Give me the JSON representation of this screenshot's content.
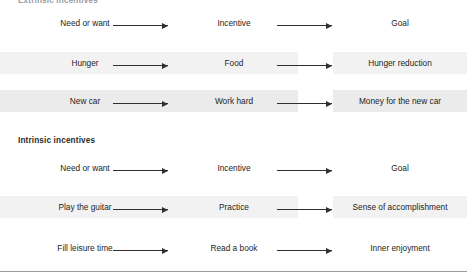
{
  "figure": {
    "sections": [
      {
        "caption": "Extrinsic incentives",
        "caption_clipped": true,
        "rows": [
          {
            "shading": "none",
            "source": "Need or want",
            "incentive": "Incentive",
            "goal": "Goal"
          },
          {
            "shading": "soft",
            "source": "Hunger",
            "incentive": "Food",
            "goal": "Hunger reduction"
          },
          {
            "shading": "strong",
            "source": "New car",
            "incentive": "Work hard",
            "goal": "Money for the new car"
          }
        ]
      },
      {
        "caption": "Intrinsic incentives",
        "caption_clipped": false,
        "rows": [
          {
            "shading": "none",
            "source": "Need or want",
            "incentive": "Incentive",
            "goal": "Goal"
          },
          {
            "shading": "soft",
            "source": "Play the guitar",
            "incentive": "Practice",
            "goal": "Sense of accomplishment"
          },
          {
            "shading": "none",
            "source": "Fill leisure time",
            "incentive": "Read a book",
            "goal": "Inner enjoyment"
          }
        ]
      }
    ],
    "colors": {
      "band_strong": "#ebebeb",
      "band_soft": "#f2f2f2",
      "arrow": "#2f2f2f",
      "text": "#1d1d1d",
      "rule": "#9a9aa0"
    }
  }
}
